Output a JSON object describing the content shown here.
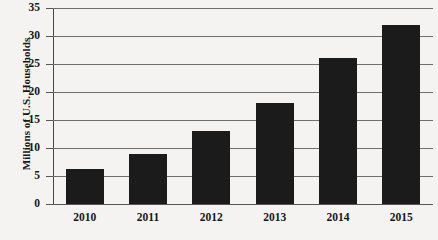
{
  "chart_data": {
    "type": "bar",
    "title": "",
    "subtitle": "",
    "xlabel": "",
    "ylabel": "Millions of U.S. Households",
    "categories": [
      "2010",
      "2011",
      "2012",
      "2013",
      "2014",
      "2015"
    ],
    "values": [
      6.3,
      9,
      13,
      18,
      26,
      32
    ],
    "series": [
      {
        "name": "Millions of U.S. Households",
        "values": [
          6.3,
          9,
          13,
          18,
          26,
          32
        ]
      }
    ],
    "ylim": [
      0,
      35
    ],
    "ytick_values": [
      0,
      5,
      10,
      15,
      20,
      25,
      30,
      35
    ],
    "ytick_labels": [
      "0",
      "5",
      "10",
      "15",
      "20",
      "25",
      "30",
      "35"
    ],
    "grid": true,
    "grid_axis": "y",
    "legend": false,
    "legend_position": "none",
    "bar_color": "#1b1b1b",
    "grid_color": "#6f6f71",
    "axis_color": "#48484b",
    "text_color": "#17171a",
    "background_color": "#f4f3f1",
    "annotations": []
  },
  "axis": {
    "y_title": "Millions of U.S. Households"
  }
}
